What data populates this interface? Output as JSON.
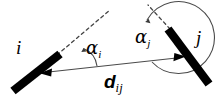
{
  "figure": {
    "name": "two-segment-angle-distance-diagram",
    "width": 221,
    "height": 101,
    "background_color": "#ffffff",
    "ink_color": "#000000",
    "thin_line_color": "#555555",
    "labels": {
      "node_i": "i",
      "node_j": "j",
      "angle_i_symbol": "α",
      "angle_i_subscript": "i",
      "angle_j_symbol": "α",
      "angle_j_subscript": "j",
      "distance_symbol": "d",
      "distance_subscript": "ij"
    },
    "elements": {
      "bar_i": "thick-segment-i",
      "bar_j": "thick-segment-j",
      "dashed_i": "dashed-extension-i",
      "dashed_j": "dashed-extension-j",
      "arc_i": "angle-arc-alpha-i",
      "arc_j": "angle-arc-alpha-j",
      "distance_arrow": "double-headed-distance-arrow"
    }
  }
}
